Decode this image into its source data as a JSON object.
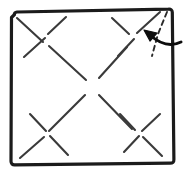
{
  "figure": {
    "type": "origami-fold-diagram",
    "canvas": {
      "width": 184,
      "height": 174
    },
    "colors": {
      "paper": "#ffffff",
      "border": "#1b1b1b",
      "crease": "#3a3a3a",
      "fold_dashed": "#2a2a2a",
      "arrow": "#0d0d0d"
    }
  },
  "sheet": {
    "name": "paper-square",
    "stroke_width": 3.2,
    "corners": [
      {
        "label": "top-left",
        "x": 14,
        "y": 13
      },
      {
        "label": "top-right",
        "x": 172,
        "y": 9
      },
      {
        "label": "bottom-right",
        "x": 174,
        "y": 163
      },
      {
        "label": "bottom-left",
        "x": 11,
        "y": 165
      }
    ]
  },
  "creases": {
    "stroke_width": 2.1,
    "style": "solid",
    "segments": [
      {
        "name": "crease-tl-quadrant-down-right",
        "x1": 17,
        "y1": 18,
        "x2": 43,
        "y2": 42
      },
      {
        "name": "crease-tl-quadrant-up-right",
        "x1": 24,
        "y1": 57,
        "x2": 45,
        "y2": 38
      },
      {
        "name": "crease-tl-center-down-right",
        "x1": 48,
        "y1": 34,
        "x2": 66,
        "y2": 17
      },
      {
        "name": "crease-tl-to-center",
        "x1": 49,
        "y1": 46,
        "x2": 86,
        "y2": 80
      },
      {
        "name": "crease-tr-quadrant-down-right",
        "x1": 112,
        "y1": 18,
        "x2": 129,
        "y2": 34
      },
      {
        "name": "crease-tr-quadrant-up-right",
        "x1": 118,
        "y1": 56,
        "x2": 134,
        "y2": 39
      },
      {
        "name": "crease-tr-center-up-right",
        "x1": 137,
        "y1": 33,
        "x2": 160,
        "y2": 12
      },
      {
        "name": "crease-tr-to-center",
        "x1": 127,
        "y1": 47,
        "x2": 99,
        "y2": 78
      },
      {
        "name": "crease-center-down-left",
        "x1": 85,
        "y1": 95,
        "x2": 49,
        "y2": 131
      },
      {
        "name": "crease-center-down-right",
        "x1": 99,
        "y1": 95,
        "x2": 132,
        "y2": 129
      },
      {
        "name": "crease-bl-quadrant-down-right",
        "x1": 30,
        "y1": 114,
        "x2": 46,
        "y2": 131
      },
      {
        "name": "crease-bl-quadrant-up-right",
        "x1": 20,
        "y1": 158,
        "x2": 44,
        "y2": 137
      },
      {
        "name": "crease-bl-center-down-right",
        "x1": 50,
        "y1": 136,
        "x2": 68,
        "y2": 155
      },
      {
        "name": "crease-br-quadrant-down-right",
        "x1": 120,
        "y1": 114,
        "x2": 135,
        "y2": 130
      },
      {
        "name": "crease-br-quadrant-up-right",
        "x1": 124,
        "y1": 152,
        "x2": 139,
        "y2": 136
      },
      {
        "name": "crease-br-center-up-right",
        "x1": 142,
        "y1": 131,
        "x2": 160,
        "y2": 114
      },
      {
        "name": "crease-br-center-down-right",
        "x1": 143,
        "y1": 137,
        "x2": 162,
        "y2": 156
      }
    ],
    "intersections": [
      {
        "name": "x-node-top-left",
        "x": 46,
        "y": 37
      },
      {
        "name": "x-node-top-right",
        "x": 133,
        "y": 36
      },
      {
        "name": "x-node-center",
        "x": 92,
        "y": 87
      },
      {
        "name": "x-node-bottom-left",
        "x": 47,
        "y": 134
      },
      {
        "name": "x-node-bottom-right",
        "x": 138,
        "y": 133
      }
    ]
  },
  "fold_line": {
    "name": "dashed-fold-line",
    "style": "dashed",
    "stroke_width": 1.9,
    "dash_pattern": "5 4",
    "path": "M 167 12 L 158 34 L 152 56",
    "meaning": "valley fold across the top-right corner"
  },
  "arrow": {
    "name": "fold-direction-arrow",
    "stroke_width": 3.0,
    "curve_path": "M 180 43 C 170 46 160 43 151 36",
    "head": {
      "tip_x": 145,
      "tip_y": 31,
      "size": 9,
      "angle_deg": 215
    },
    "meaning": "fold corner toward the interior"
  },
  "labels": {
    "visible_text": []
  }
}
